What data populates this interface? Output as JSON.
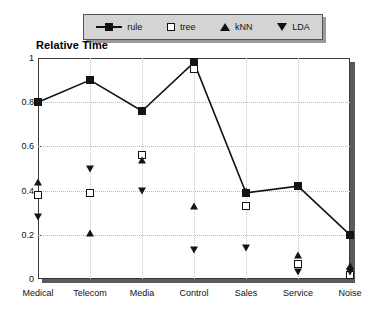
{
  "title": "Relative Time",
  "legend": {
    "entries": [
      {
        "label": "rule",
        "marker": "filled-square-line"
      },
      {
        "label": "tree",
        "marker": "open-square"
      },
      {
        "label": "kNN",
        "marker": "triangle-up"
      },
      {
        "label": "LDA",
        "marker": "triangle-down"
      }
    ]
  },
  "axes": {
    "y_ticks": [
      "0",
      "0.2",
      "0.4",
      "0.6",
      "0.8",
      "1"
    ],
    "x_ticks": [
      "Medical",
      "Telecom",
      "Media",
      "Control",
      "Sales",
      "Service",
      "Noise"
    ]
  },
  "chart_data": {
    "type": "line",
    "title": "Relative Time",
    "xlabel": "",
    "ylabel": "Relative Time",
    "ylim": [
      0,
      1
    ],
    "yticks": [
      0,
      0.2,
      0.4,
      0.6,
      0.8,
      1
    ],
    "grid": true,
    "legend_position": "top",
    "categories": [
      "Medical",
      "Telecom",
      "Media",
      "Control",
      "Sales",
      "Service",
      "Noise"
    ],
    "series": [
      {
        "name": "rule",
        "marker": "filled-square",
        "line": true,
        "values": [
          0.8,
          0.9,
          0.76,
          0.98,
          0.39,
          0.42,
          0.2
        ]
      },
      {
        "name": "tree",
        "marker": "open-square",
        "line": false,
        "values": [
          0.38,
          0.39,
          0.56,
          0.95,
          0.33,
          0.07,
          0.02
        ]
      },
      {
        "name": "kNN",
        "marker": "triangle-up",
        "line": false,
        "values": [
          0.44,
          0.21,
          0.54,
          0.33,
          0.4,
          0.11,
          0.06
        ]
      },
      {
        "name": "LDA",
        "marker": "triangle-down",
        "line": false,
        "values": [
          0.28,
          0.5,
          0.4,
          0.13,
          0.14,
          0.03,
          0.03
        ]
      }
    ]
  },
  "colors": {
    "ink": "#141414",
    "legend_bg": "#d4d4d4",
    "axis": "#3a3a3a",
    "grid": "#b9b9b9",
    "shadow": "#5a5a5a"
  }
}
